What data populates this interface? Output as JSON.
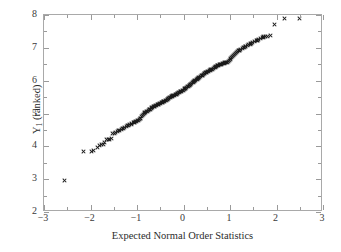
{
  "chart_data": {
    "type": "scatter",
    "title": "",
    "xlabel": "Expected Normal Order Statistics",
    "ylabel": "Y1 (ranked)",
    "ylabel_base": "Y",
    "ylabel_sub": "1",
    "ylabel_rest": " (ranked)",
    "xlim": [
      -3,
      3
    ],
    "ylim": [
      2,
      8
    ],
    "grid": false,
    "legend": null,
    "marker": "x",
    "marker_color": "#1a1a1a",
    "frame_color": "#a9a9a9",
    "background": "#ffffff",
    "xticks": [
      -3,
      -2,
      -1,
      0,
      1,
      2,
      3
    ],
    "xticklabels": [
      "−3",
      "−2",
      "−1",
      "0",
      "1",
      "2",
      "3"
    ],
    "xminorticks": [
      -2.5,
      -1.5,
      -0.5,
      0.5,
      1.5,
      2.5
    ],
    "yticks": [
      2,
      3,
      4,
      5,
      6,
      7,
      8
    ],
    "yticklabels": [
      "2",
      "3",
      "4",
      "5",
      "6",
      "7",
      "8"
    ],
    "yminorticks": [
      2.5,
      3.5,
      4.5,
      5.5,
      6.5,
      7.5
    ],
    "n_points": 195,
    "points": [
      [
        -2.57,
        2.95
      ],
      [
        -2.15,
        3.83
      ],
      [
        -1.97,
        3.85
      ],
      [
        -1.93,
        3.86
      ],
      [
        -1.86,
        3.97
      ],
      [
        -1.8,
        4.03
      ],
      [
        -1.76,
        4.06
      ],
      [
        -1.72,
        4.07
      ],
      [
        -1.69,
        4.12
      ],
      [
        -1.65,
        4.2
      ],
      [
        -1.62,
        4.21
      ],
      [
        -1.59,
        4.22
      ],
      [
        -1.56,
        4.23
      ],
      [
        -1.52,
        4.38
      ],
      [
        -1.49,
        4.4
      ],
      [
        -1.46,
        4.41
      ],
      [
        -1.43,
        4.46
      ],
      [
        -1.4,
        4.47
      ],
      [
        -1.37,
        4.48
      ],
      [
        -1.34,
        4.52
      ],
      [
        -1.31,
        4.53
      ],
      [
        -1.29,
        4.54
      ],
      [
        -1.26,
        4.58
      ],
      [
        -1.23,
        4.6
      ],
      [
        -1.21,
        4.62
      ],
      [
        -1.18,
        4.64
      ],
      [
        -1.16,
        4.66
      ],
      [
        -1.13,
        4.68
      ],
      [
        -1.11,
        4.7
      ],
      [
        -1.08,
        4.72
      ],
      [
        -1.06,
        4.74
      ],
      [
        -1.04,
        4.76
      ],
      [
        -1.01,
        4.77
      ],
      [
        -0.99,
        4.79
      ],
      [
        -0.97,
        4.8
      ],
      [
        -0.95,
        4.83
      ],
      [
        -0.92,
        4.86
      ],
      [
        -0.9,
        4.9
      ],
      [
        -0.88,
        4.94
      ],
      [
        -0.86,
        4.98
      ],
      [
        -0.84,
        5.01
      ],
      [
        -0.82,
        5.03
      ],
      [
        -0.8,
        5.05
      ],
      [
        -0.78,
        5.07
      ],
      [
        -0.76,
        5.09
      ],
      [
        -0.74,
        5.11
      ],
      [
        -0.72,
        5.13
      ],
      [
        -0.7,
        5.15
      ],
      [
        -0.68,
        5.17
      ],
      [
        -0.66,
        5.19
      ],
      [
        -0.64,
        5.21
      ],
      [
        -0.62,
        5.22
      ],
      [
        -0.6,
        5.24
      ],
      [
        -0.58,
        5.25
      ],
      [
        -0.56,
        5.27
      ],
      [
        -0.54,
        5.28
      ],
      [
        -0.52,
        5.29
      ],
      [
        -0.5,
        5.31
      ],
      [
        -0.48,
        5.33
      ],
      [
        -0.46,
        5.34
      ],
      [
        -0.45,
        5.35
      ],
      [
        -0.43,
        5.37
      ],
      [
        -0.41,
        5.38
      ],
      [
        -0.39,
        5.4
      ],
      [
        -0.37,
        5.41
      ],
      [
        -0.35,
        5.43
      ],
      [
        -0.33,
        5.45
      ],
      [
        -0.32,
        5.46
      ],
      [
        -0.3,
        5.48
      ],
      [
        -0.28,
        5.49
      ],
      [
        -0.26,
        5.51
      ],
      [
        -0.24,
        5.52
      ],
      [
        -0.23,
        5.54
      ],
      [
        -0.21,
        5.55
      ],
      [
        -0.19,
        5.56
      ],
      [
        -0.17,
        5.58
      ],
      [
        -0.15,
        5.59
      ],
      [
        -0.14,
        5.61
      ],
      [
        -0.12,
        5.62
      ],
      [
        -0.1,
        5.64
      ],
      [
        -0.08,
        5.65
      ],
      [
        -0.07,
        5.67
      ],
      [
        -0.05,
        5.68
      ],
      [
        -0.03,
        5.7
      ],
      [
        -0.01,
        5.71
      ],
      [
        0.01,
        5.73
      ],
      [
        0.03,
        5.75
      ],
      [
        0.05,
        5.77
      ],
      [
        0.07,
        5.79
      ],
      [
        0.08,
        5.81
      ],
      [
        0.1,
        5.83
      ],
      [
        0.12,
        5.85
      ],
      [
        0.14,
        5.87
      ],
      [
        0.15,
        5.89
      ],
      [
        0.17,
        5.91
      ],
      [
        0.19,
        5.93
      ],
      [
        0.21,
        5.95
      ],
      [
        0.23,
        5.97
      ],
      [
        0.24,
        5.99
      ],
      [
        0.26,
        6.01
      ],
      [
        0.28,
        6.03
      ],
      [
        0.3,
        6.05
      ],
      [
        0.32,
        6.07
      ],
      [
        0.33,
        6.09
      ],
      [
        0.35,
        6.11
      ],
      [
        0.37,
        6.13
      ],
      [
        0.39,
        6.15
      ],
      [
        0.41,
        6.17
      ],
      [
        0.43,
        6.19
      ],
      [
        0.45,
        6.21
      ],
      [
        0.46,
        6.22
      ],
      [
        0.48,
        6.24
      ],
      [
        0.5,
        6.26
      ],
      [
        0.52,
        6.27
      ],
      [
        0.54,
        6.29
      ],
      [
        0.56,
        6.3
      ],
      [
        0.58,
        6.32
      ],
      [
        0.6,
        6.33
      ],
      [
        0.62,
        6.35
      ],
      [
        0.64,
        6.37
      ],
      [
        0.66,
        6.39
      ],
      [
        0.68,
        6.41
      ],
      [
        0.7,
        6.43
      ],
      [
        0.72,
        6.45
      ],
      [
        0.74,
        6.46
      ],
      [
        0.76,
        6.47
      ],
      [
        0.78,
        6.48
      ],
      [
        0.8,
        6.49
      ],
      [
        0.82,
        6.5
      ],
      [
        0.84,
        6.51
      ],
      [
        0.86,
        6.52
      ],
      [
        0.88,
        6.53
      ],
      [
        0.9,
        6.54
      ],
      [
        0.92,
        6.55
      ],
      [
        0.95,
        6.56
      ],
      [
        0.97,
        6.58
      ],
      [
        0.99,
        6.62
      ],
      [
        1.01,
        6.66
      ],
      [
        1.04,
        6.7
      ],
      [
        1.06,
        6.74
      ],
      [
        1.08,
        6.78
      ],
      [
        1.11,
        6.82
      ],
      [
        1.13,
        6.86
      ],
      [
        1.16,
        6.89
      ],
      [
        1.18,
        6.91
      ],
      [
        1.21,
        6.93
      ],
      [
        1.23,
        6.95
      ],
      [
        1.26,
        6.98
      ],
      [
        1.29,
        7.0
      ],
      [
        1.31,
        7.02
      ],
      [
        1.34,
        7.04
      ],
      [
        1.37,
        7.06
      ],
      [
        1.4,
        7.09
      ],
      [
        1.43,
        7.11
      ],
      [
        1.46,
        7.13
      ],
      [
        1.49,
        7.16
      ],
      [
        1.52,
        7.18
      ],
      [
        1.56,
        7.21
      ],
      [
        1.59,
        7.23
      ],
      [
        1.62,
        7.25
      ],
      [
        1.65,
        7.27
      ],
      [
        1.69,
        7.3
      ],
      [
        1.72,
        7.33
      ],
      [
        1.76,
        7.35
      ],
      [
        1.8,
        7.36
      ],
      [
        1.86,
        7.38
      ],
      [
        1.95,
        7.7
      ],
      [
        2.17,
        7.88
      ],
      [
        2.5,
        7.9
      ],
      [
        -1.05,
        4.73
      ],
      [
        -0.93,
        4.85
      ],
      [
        -0.83,
        5.02
      ],
      [
        -0.73,
        5.12
      ],
      [
        -0.63,
        5.21
      ],
      [
        -0.53,
        5.28
      ],
      [
        -0.44,
        5.36
      ],
      [
        -0.34,
        5.44
      ],
      [
        -0.25,
        5.52
      ],
      [
        -0.16,
        5.58
      ],
      [
        -0.06,
        5.67
      ],
      [
        0.04,
        5.76
      ],
      [
        0.13,
        5.86
      ],
      [
        0.22,
        5.96
      ],
      [
        0.31,
        6.06
      ],
      [
        0.4,
        6.16
      ],
      [
        0.49,
        6.25
      ],
      [
        0.59,
        6.33
      ],
      [
        0.69,
        6.42
      ],
      [
        0.79,
        6.49
      ],
      [
        0.89,
        6.54
      ],
      [
        1.0,
        6.64
      ],
      [
        1.1,
        6.8
      ],
      [
        1.2,
        6.92
      ],
      [
        1.33,
        7.03
      ],
      [
        1.45,
        7.12
      ],
      [
        1.58,
        7.22
      ],
      [
        1.71,
        7.32
      ]
    ]
  }
}
